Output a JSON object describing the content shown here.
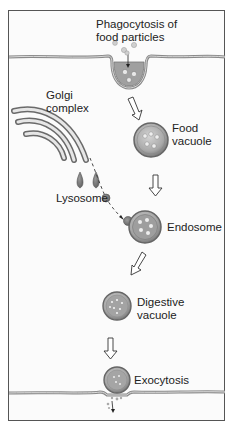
{
  "figure": {
    "colors": {
      "frame": "#555555",
      "membrane": "#8a8a8a",
      "vesicle_fill": "#b8b8b8",
      "vesicle_rim": "#6e6e6e",
      "particle": "#e8e8e8",
      "text": "#222222"
    }
  },
  "labels": {
    "phagocytosis_line1": "Phagocytosis of",
    "phagocytosis_line2": "food particles",
    "golgi_line1": "Golgi",
    "golgi_line2": "complex",
    "food_vacuole_line1": "Food",
    "food_vacuole_line2": "vacuole",
    "lysosome": "Lysosome",
    "endosome": "Endosome",
    "digestive_line1": "Digestive",
    "digestive_line2": "vacuole",
    "exocytosis": "Exocytosis"
  },
  "stages": [
    {
      "name": "Phagocytosis of food particles"
    },
    {
      "name": "Food vacuole"
    },
    {
      "name": "Endosome"
    },
    {
      "name": "Digestive vacuole"
    },
    {
      "name": "Exocytosis"
    }
  ]
}
